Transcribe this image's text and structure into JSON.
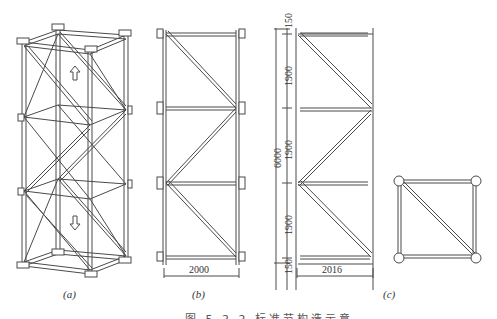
{
  "figure": {
    "caption": "图 5.2.2  标准节构造示意",
    "panels": [
      {
        "id": "a",
        "label": "(a)",
        "description": "isometric view of lattice tower standard section",
        "arrows": [
          "up-arrow",
          "down-arrow"
        ]
      },
      {
        "id": "b",
        "label": "(b)",
        "description": "side elevation",
        "width_dimension": "2000"
      },
      {
        "id": "c",
        "label": "(c)",
        "description": "diagonal bracing elevation and plan section",
        "width_dimension": "2016",
        "total_height": "6000",
        "segments": [
          "150",
          "1900",
          "1900",
          "1900",
          "150"
        ]
      }
    ]
  },
  "colors": {
    "line": "#444444",
    "background": "#ffffff"
  }
}
